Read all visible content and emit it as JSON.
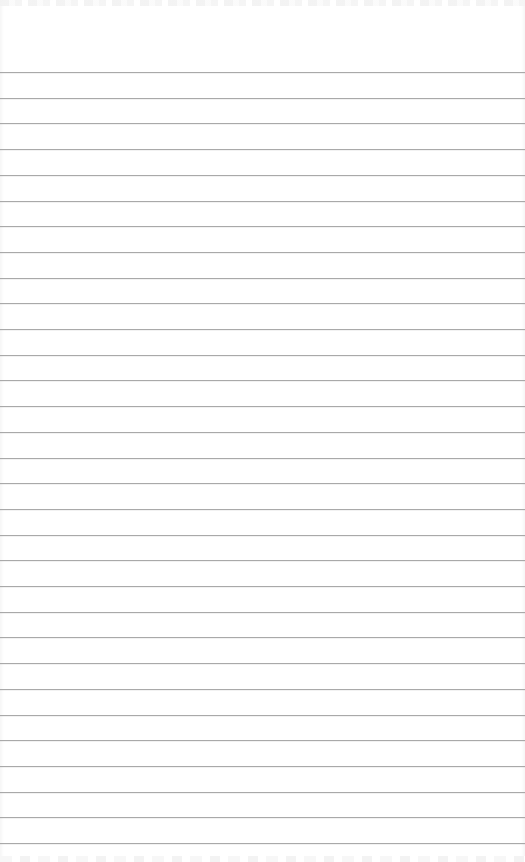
{
  "page": {
    "type": "ruled-notepad",
    "line_count": 31,
    "colors": {
      "paper": "#ffffff",
      "rule": "#a9a9a9"
    }
  }
}
